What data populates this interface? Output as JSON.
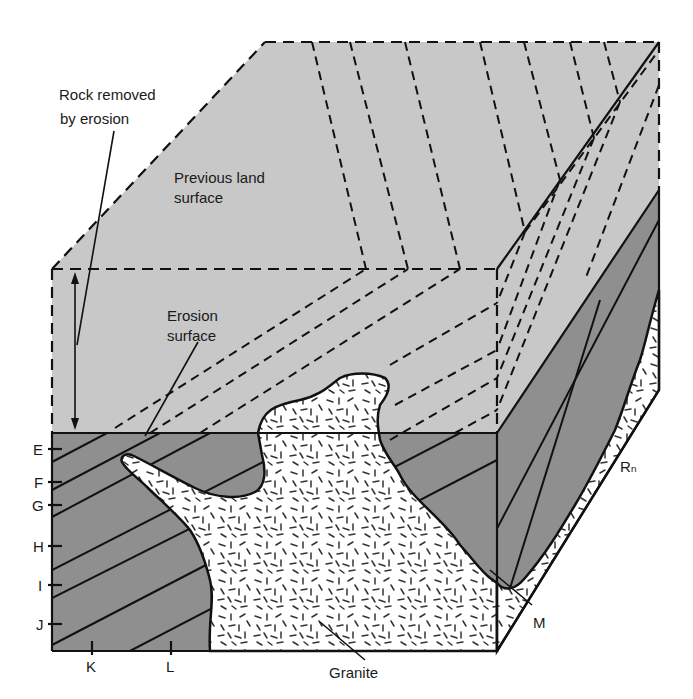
{
  "figure": {
    "type": "block diagram"
  },
  "colors": {
    "background": "#ffffff",
    "removed_rock": "#c8c8c8",
    "strata": "#8f8f8f",
    "granite": "#ffffff",
    "ink": "#111111"
  },
  "labels": {
    "rock_removed": [
      "Rock removed",
      "by erosion"
    ],
    "previous_land_surface": [
      "Previous land",
      "surface"
    ],
    "erosion_surface": [
      "Erosion",
      "surface"
    ],
    "granite": "Granite",
    "rn": "Rₙ",
    "m": "M"
  },
  "left_axis": {
    "ticks": [
      "E",
      "F",
      "G",
      "H",
      "I",
      "J"
    ]
  },
  "bottom_axis": {
    "ticks": [
      "K",
      "L"
    ]
  }
}
